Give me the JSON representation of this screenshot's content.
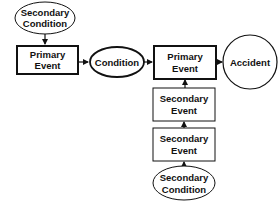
{
  "diagram": {
    "nodes": {
      "secondary_condition_top": {
        "line1": "Secondary",
        "line2": "Condition",
        "shape": "ellipse"
      },
      "primary_event_left": {
        "line1": "Primary",
        "line2": "Event",
        "shape": "rect-bold"
      },
      "condition": {
        "label": "Condition",
        "shape": "ellipse-bold"
      },
      "primary_event_right": {
        "line1": "Primary",
        "line2": "Event",
        "shape": "rect-bold"
      },
      "accident": {
        "label": "Accident",
        "shape": "circle"
      },
      "secondary_event_1": {
        "line1": "Secondary",
        "line2": "Event",
        "shape": "rect"
      },
      "secondary_event_2": {
        "line1": "Secondary",
        "line2": "Event",
        "shape": "rect"
      },
      "secondary_condition_bottom": {
        "line1": "Secondary",
        "line2": "Condition",
        "shape": "ellipse"
      }
    },
    "edges": [
      {
        "from": "Secondary Condition (top)",
        "to": "Primary Event (left)"
      },
      {
        "from": "Primary Event (left)",
        "to": "Condition"
      },
      {
        "from": "Condition",
        "to": "Primary Event (right)"
      },
      {
        "from": "Primary Event (right)",
        "to": "Accident"
      },
      {
        "from": "Secondary Event 1",
        "to": "Primary Event (right)"
      },
      {
        "from": "Secondary Event 2",
        "to": "Secondary Event 1"
      },
      {
        "from": "Secondary Condition (bottom)",
        "to": "Secondary Event 2"
      }
    ],
    "colors": {
      "stroke": "#111111",
      "fill": "#ffffff",
      "background": "#ffffff"
    }
  }
}
